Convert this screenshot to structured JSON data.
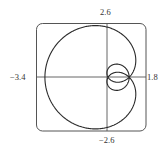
{
  "chart_data": {
    "type": "line",
    "title": "",
    "curve": "polar r = 1 + 2 sin(θ/2), 0 ≤ θ ≤ 4π",
    "xlabel": "",
    "ylabel": "",
    "xlim": [
      -3.4,
      1.8
    ],
    "ylim": [
      -2.6,
      2.6
    ],
    "grid": false,
    "legend": null,
    "tick_labels": {
      "x_min": "−3.4",
      "x_max": "1.8",
      "y_max": "2.6",
      "y_min": "−2.6"
    },
    "key_points": [
      {
        "x": -3.0,
        "y": 0.0
      },
      {
        "x": 1.0,
        "y": 0.0
      },
      {
        "x": 0.0,
        "y": 0.0
      }
    ]
  },
  "colors": {
    "curve": "#2a2a2a",
    "axes": "#555555",
    "frame": "#555555"
  }
}
